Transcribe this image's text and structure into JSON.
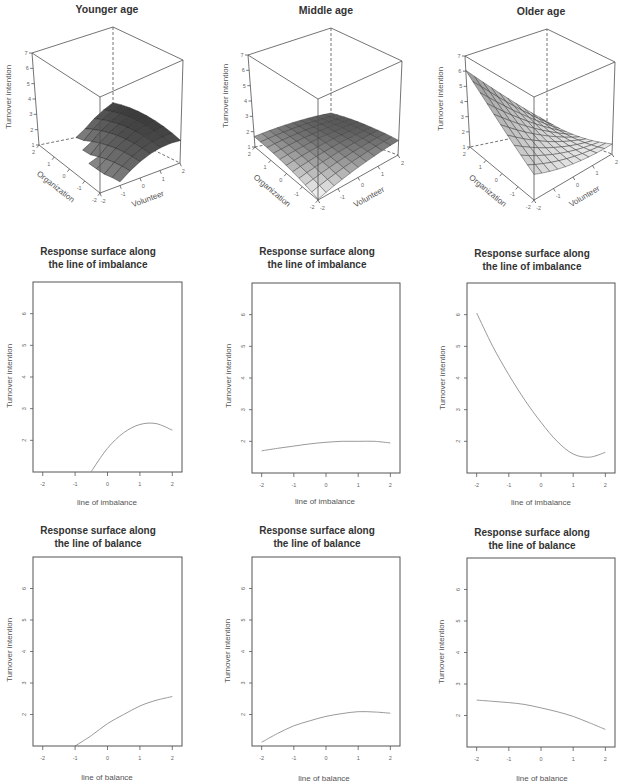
{
  "chart_data": [
    {
      "type": "surface3d",
      "title": "Younger age",
      "xlabel": "Organization",
      "ylabel": "Volunteer",
      "zlabel": "Turnover intention",
      "xlim": [
        -2,
        2
      ],
      "ylim": [
        -2,
        2
      ],
      "zlim": [
        1,
        7
      ],
      "x_ticks": [
        2,
        1,
        0,
        -1,
        -2
      ],
      "y_ticks": [
        -2,
        -1,
        0,
        1,
        2
      ],
      "z_ticks": [
        1,
        2,
        3,
        4,
        5,
        6,
        7
      ],
      "grid_steps": 8,
      "model": {
        "intercept": 1.75,
        "organization": -0.29,
        "volunteer": 0.92,
        "organization_sq": -0.085,
        "org_x_vol": 0.18,
        "volunteer_sq": -0.2
      },
      "z_matrix": {
        "organization": [
          -2,
          -1,
          0,
          1,
          2
        ],
        "volunteer": [
          -2,
          -1,
          0,
          1,
          2
        ],
        "values": [
          [
            null,
            1.23,
            1.99,
            2.35,
            2.31
          ],
          [
            null,
            1.02,
            1.96,
            2.5,
            2.64
          ],
          [
            null,
            null,
            1.75,
            2.47,
            2.79
          ],
          [
            null,
            null,
            1.38,
            2.28,
            2.78
          ],
          [
            null,
            null,
            null,
            1.91,
            2.59
          ]
        ]
      },
      "colors": {
        "high": "#3d3d3d",
        "low": "#8c8c8c",
        "mesh": "#222222"
      }
    },
    {
      "type": "surface3d",
      "title": "Middle age",
      "xlabel": "Organization",
      "ylabel": "Volunteer",
      "zlabel": "Turnover intention",
      "xlim": [
        -2,
        2
      ],
      "ylim": [
        -2,
        2
      ],
      "zlim": [
        1,
        7
      ],
      "x_ticks": [
        2,
        1,
        0,
        -1,
        -2
      ],
      "y_ticks": [
        -2,
        -1,
        0,
        1,
        2
      ],
      "z_ticks": [
        1,
        2,
        3,
        4,
        5,
        6,
        7
      ],
      "grid_steps": 10,
      "model": {
        "intercept": 1.95,
        "organization": 0.094,
        "volunteer": 0.156,
        "organization_sq": -0.034,
        "org_x_vol": -0.032,
        "volunteer_sq": -0.034
      },
      "z_matrix": {
        "organization": [
          -2,
          -1,
          0,
          1,
          2
        ],
        "volunteer": [
          -2,
          -1,
          0,
          1,
          2
        ],
        "values": [
          [
            1.05,
            1.37,
            1.63,
            1.81,
            1.93
          ],
          [
            1.31,
            1.6,
            1.82,
            1.98,
            2.06
          ],
          [
            1.5,
            1.76,
            1.95,
            2.07,
            2.13
          ],
          [
            1.63,
            1.85,
            2.01,
            2.1,
            2.12
          ],
          [
            1.68,
            1.88,
            2.0,
            2.06,
            2.05
          ]
        ]
      },
      "colors": {
        "high": "#5a5a5a",
        "low": "#eeeeee",
        "mesh": "#3a3a3a"
      }
    },
    {
      "type": "surface3d",
      "title": "Older age",
      "xlabel": "Organization",
      "ylabel": "Volunteer",
      "zlabel": "Turnover intention",
      "xlim": [
        -2,
        2
      ],
      "ylim": [
        -2,
        2
      ],
      "zlim": [
        1,
        7
      ],
      "x_ticks": [
        2,
        1,
        0,
        -1,
        -2
      ],
      "y_ticks": [
        -2,
        -1,
        0,
        1,
        2
      ],
      "z_ticks": [
        1,
        2,
        3,
        4,
        5,
        6,
        7
      ],
      "grid_steps": 10,
      "model": {
        "intercept": 2.42,
        "organization": 0.434,
        "volunteer": -0.666,
        "organization_sq": 0.065,
        "org_x_vol": -0.228,
        "volunteer_sq": 0.065
      },
      "z_matrix": {
        "organization": [
          -2,
          -1,
          0,
          1,
          2
        ],
        "volunteer": [
          -2,
          -1,
          0,
          1,
          2
        ],
        "values": [
          [
            2.49,
            2.09,
            1.81,
            1.67,
            1.65
          ],
          [
            3.19,
            2.55,
            2.05,
            1.68,
            1.44
          ],
          [
            4.01,
            3.15,
            2.42,
            1.82,
            1.35
          ],
          [
            4.97,
            3.88,
            2.92,
            2.09,
            1.39
          ],
          [
            6.05,
            4.74,
            3.55,
            2.49,
            1.56
          ]
        ]
      },
      "colors": {
        "high": "#b2b2b2",
        "low": "#f2f2f2",
        "mesh": "#333333"
      }
    },
    {
      "type": "line",
      "title": "Response surface along the line of imbalance",
      "title_lines": [
        "Response surface along",
        "the line of imbalance"
      ],
      "xlabel": "line of imbalance",
      "ylabel": "Turnover intention",
      "xlim": [
        -2.3,
        2.3
      ],
      "ylim": [
        1,
        7
      ],
      "x_ticks": [
        -2,
        -1,
        0,
        1,
        2
      ],
      "y_ticks": [
        2,
        3,
        4,
        5,
        6
      ],
      "x": [
        -2,
        -1.5,
        -1,
        -0.5,
        0,
        0.5,
        1,
        1.5,
        2
      ],
      "y": [
        null,
        null,
        null,
        1.02,
        1.75,
        2.24,
        2.5,
        2.53,
        2.32
      ]
    },
    {
      "type": "line",
      "title": "Response surface along the line of imbalance",
      "title_lines": [
        "Response surface along",
        "the line of imbalance"
      ],
      "xlabel": "line of imbalance",
      "ylabel": "Turnover intention",
      "xlim": [
        -2.3,
        2.3
      ],
      "ylim": [
        1,
        7
      ],
      "x_ticks": [
        -2,
        -1,
        0,
        1,
        2
      ],
      "y_ticks": [
        2,
        3,
        4,
        5,
        6
      ],
      "x": [
        -2,
        -1.5,
        -1,
        -0.5,
        0,
        0.5,
        1,
        1.5,
        2
      ],
      "y": [
        1.7,
        1.78,
        1.85,
        1.92,
        1.97,
        2.0,
        2.0,
        2.0,
        1.95
      ]
    },
    {
      "type": "line",
      "title": "Response surface along the line of imbalance",
      "title_lines": [
        "Response surface along",
        "the line of imbalance"
      ],
      "xlabel": "line of imbalance",
      "ylabel": "Turnover intention",
      "xlim": [
        -2.3,
        2.3
      ],
      "ylim": [
        1,
        7
      ],
      "x_ticks": [
        -2,
        -1,
        0,
        1,
        2
      ],
      "y_ticks": [
        2,
        3,
        4,
        5,
        6
      ],
      "x": [
        -2,
        -1.5,
        -1,
        -0.5,
        0,
        0.5,
        1,
        1.5,
        2
      ],
      "y": [
        6.05,
        5.0,
        4.1,
        3.3,
        2.6,
        2.0,
        1.6,
        1.5,
        1.65
      ]
    },
    {
      "type": "line",
      "title": "Response surface along the line of balance",
      "title_lines": [
        "Response surface along",
        "the line of balance"
      ],
      "xlabel": "line of balance",
      "ylabel": "Turnover intention",
      "xlim": [
        -2.3,
        2.3
      ],
      "ylim": [
        1,
        7
      ],
      "x_ticks": [
        -2,
        -1,
        0,
        1,
        2
      ],
      "y_ticks": [
        2,
        3,
        4,
        5,
        6
      ],
      "x": [
        -2,
        -1.5,
        -1,
        -0.5,
        0,
        0.5,
        1,
        1.5,
        2
      ],
      "y": [
        null,
        null,
        1.0,
        1.33,
        1.71,
        2.0,
        2.27,
        2.45,
        2.57
      ]
    },
    {
      "type": "line",
      "title": "Response surface along the line of balance",
      "title_lines": [
        "Response surface along",
        "the line of balance"
      ],
      "xlabel": "line of balance",
      "ylabel": "Turnover intention",
      "xlim": [
        -2.3,
        2.3
      ],
      "ylim": [
        1,
        7
      ],
      "x_ticks": [
        -2,
        -1,
        0,
        1,
        2
      ],
      "y_ticks": [
        2,
        3,
        4,
        5,
        6
      ],
      "x": [
        -2,
        -1.5,
        -1,
        -0.5,
        0,
        0.5,
        1,
        1.5,
        2
      ],
      "y": [
        1.12,
        1.4,
        1.64,
        1.8,
        1.94,
        2.03,
        2.09,
        2.08,
        2.04
      ]
    },
    {
      "type": "line",
      "title": "Response surface along the line of balance",
      "title_lines": [
        "Response surface along",
        "the line of balance"
      ],
      "xlabel": "line of balance",
      "ylabel": "Turnover intention",
      "xlim": [
        -2.3,
        2.3
      ],
      "ylim": [
        1,
        7
      ],
      "x_ticks": [
        -2,
        -1,
        0,
        1,
        2
      ],
      "y_ticks": [
        2,
        3,
        4,
        5,
        6
      ],
      "x": [
        -2,
        -1.5,
        -1,
        -0.5,
        0,
        0.5,
        1,
        1.5,
        2
      ],
      "y": [
        2.49,
        2.45,
        2.41,
        2.35,
        2.24,
        2.12,
        1.97,
        1.77,
        1.56
      ]
    }
  ]
}
